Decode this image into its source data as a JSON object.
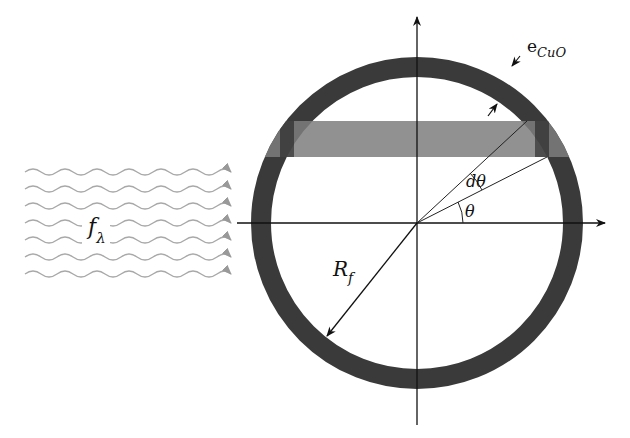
{
  "diagram": {
    "labels": {
      "thickness": "e",
      "thickness_sub": "CuO",
      "dtheta": "dθ",
      "theta": "θ",
      "radius": "R",
      "radius_sub": "f",
      "flux": "f",
      "flux_sub": "λ"
    },
    "colors": {
      "ring": "#3a3a3a",
      "band": "#808080",
      "wave": "#a8a8a8",
      "line": "#111111"
    },
    "wave_count": 7
  }
}
